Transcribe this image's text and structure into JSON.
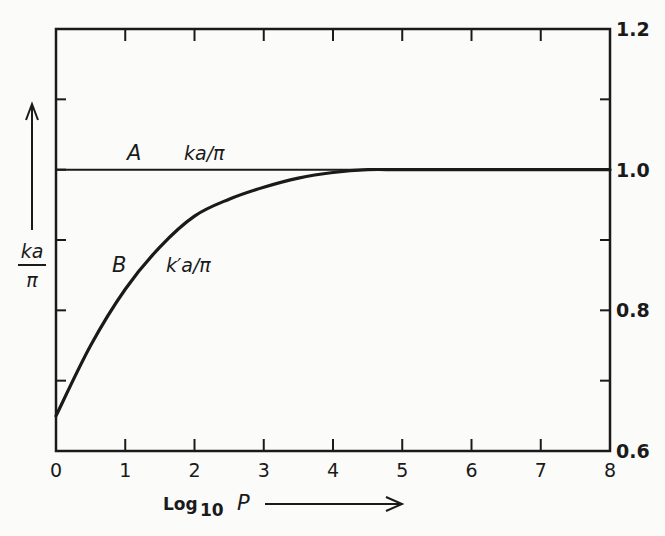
{
  "chart_data": {
    "type": "line",
    "title": "",
    "xlabel": "Log 10 P",
    "ylabel": "ka/π",
    "xlim": [
      0,
      8
    ],
    "ylim": [
      0.6,
      1.2
    ],
    "x_ticks": [
      0,
      1,
      2,
      3,
      4,
      5,
      6,
      7,
      8
    ],
    "x_tick_labels": [
      "0",
      "1",
      "2",
      "3",
      "4",
      "5",
      "6",
      "7",
      "8"
    ],
    "y_ticks_minor": [
      0.6,
      0.7,
      0.8,
      0.9,
      1.0,
      1.1,
      1.2
    ],
    "y_tick_labels": [
      {
        "value": 0.6,
        "label": "0.6"
      },
      {
        "value": 0.8,
        "label": "0.8"
      },
      {
        "value": 1.0,
        "label": "1.0"
      },
      {
        "value": 1.2,
        "label": "1.2"
      }
    ],
    "y_tick_labels_side": "right",
    "grid": false,
    "series": [
      {
        "name": "A",
        "expression": "ka/π",
        "x": [
          0,
          8
        ],
        "values": [
          1.0,
          1.0
        ]
      },
      {
        "name": "B",
        "expression": "k'a/π",
        "x": [
          0,
          0.5,
          1,
          1.5,
          2,
          2.5,
          3,
          3.5,
          4,
          4.5,
          5,
          6,
          7,
          8
        ],
        "values": [
          0.65,
          0.75,
          0.83,
          0.89,
          0.934,
          0.958,
          0.975,
          0.988,
          0.996,
          1.0,
          1.0,
          1.0,
          1.0,
          1.0
        ]
      }
    ],
    "annotations": [
      "A",
      "ka/π",
      "B",
      "k'a/π"
    ]
  },
  "labels": {
    "series_a_letter": "A",
    "series_a_expr": "ka/π",
    "series_b_letter": "B",
    "series_b_expr": "k′a/π",
    "y_title_num": "ka",
    "y_title_den": "π",
    "x_title_log": "Log",
    "x_title_sub": "10",
    "x_title_var": "P"
  }
}
